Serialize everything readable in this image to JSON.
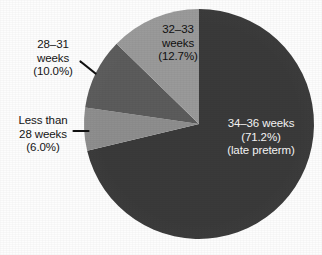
{
  "figure": {
    "width": 322,
    "height": 255,
    "background": "#fdfdfd"
  },
  "chart_data": {
    "type": "pie",
    "title": "",
    "subtitle": "",
    "xlabel": "",
    "ylabel": "",
    "legend_position": "none",
    "grid": false,
    "start_angle_deg": 0,
    "direction": "clockwise",
    "center": {
      "x": 199,
      "y": 124
    },
    "radius": 115,
    "categories": [
      "34–36 weeks",
      "Less than 28 weeks",
      "28–31 weeks",
      "32–33 weeks"
    ],
    "values": [
      71.2,
      6.0,
      10.0,
      12.7
    ],
    "value_labels": [
      "(71.2%)",
      "(6.0%)",
      "(10.0%)",
      "(12.7%)"
    ],
    "units": "percent",
    "slices": [
      {
        "name": "34–36 weeks",
        "value": 71.2,
        "color": "#3a3a3a",
        "label_lines": [
          "34–36 weeks",
          "(71.2%)",
          "(late preterm)"
        ],
        "label_placement": "inside",
        "label_color": "#f2f2f2",
        "annotation": "(late preterm)",
        "leader": false
      },
      {
        "name": "Less than 28 weeks",
        "value": 6.0,
        "color": "#8e8e8e",
        "label_lines": [
          "Less than",
          "28 weeks",
          "(6.0%)"
        ],
        "label_placement": "outside-left",
        "label_color": "#141414",
        "leader": true
      },
      {
        "name": "28–31 weeks",
        "value": 10.0,
        "color": "#5c5c5c",
        "label_lines": [
          "28–31",
          "weeks",
          "(10.0%)"
        ],
        "label_placement": "outside-left",
        "label_color": "#141414",
        "leader": true
      },
      {
        "name": "32–33 weeks",
        "value": 12.7,
        "color": "#9a9a9a",
        "label_lines": [
          "32–33",
          "weeks",
          "(12.7%)"
        ],
        "label_placement": "inside",
        "label_color": "#101010",
        "leader": false
      }
    ],
    "colors": [
      "#3a3a3a",
      "#8e8e8e",
      "#5c5c5c",
      "#9a9a9a"
    ],
    "total": 99.9
  },
  "labels": {
    "late_preterm": {
      "line1": "34–36 weeks",
      "line2": "(71.2%)",
      "line3": "(late preterm)"
    },
    "weeks_32_33": {
      "line1": "32–33",
      "line2": "weeks",
      "line3": "(12.7%)"
    },
    "weeks_28_31": {
      "line1": "28–31",
      "line2": "weeks",
      "line3": "(10.0%)"
    },
    "less_than_28": {
      "line1": "Less than",
      "line2": "28 weeks",
      "line3": "(6.0%)"
    }
  }
}
